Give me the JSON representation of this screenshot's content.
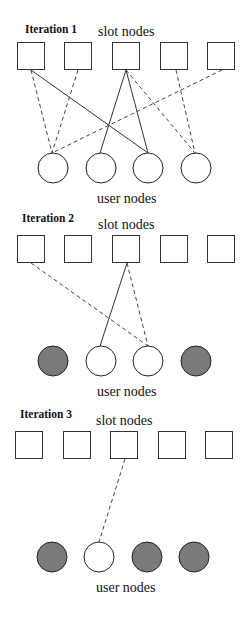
{
  "colors": {
    "assigned_fill": "#7a7a7a",
    "free_fill": "#ffffff",
    "stroke": "#333333"
  },
  "labels": {
    "slot_nodes": "slot nodes",
    "user_nodes": "user nodes"
  },
  "iterations": [
    {
      "label": "Iteration 1",
      "slot_nodes": 5,
      "user_nodes": [
        "free",
        "free",
        "free",
        "free"
      ],
      "edges": [
        {
          "slot": 1,
          "user": 1,
          "style": "dashed"
        },
        {
          "slot": 2,
          "user": 1,
          "style": "dashed"
        },
        {
          "slot": 1,
          "user": 3,
          "style": "solid"
        },
        {
          "slot": 3,
          "user": 2,
          "style": "solid"
        },
        {
          "slot": 3,
          "user": 3,
          "style": "solid"
        },
        {
          "slot": 3,
          "user": 4,
          "style": "dashed"
        },
        {
          "slot": 4,
          "user": 4,
          "style": "dashed"
        },
        {
          "slot": 5,
          "user": 1,
          "style": "dashed"
        }
      ]
    },
    {
      "label": "Iteration 2",
      "slot_nodes": 5,
      "user_nodes": [
        "assigned",
        "free",
        "free",
        "assigned"
      ],
      "edges": [
        {
          "slot": 1,
          "user": 3,
          "style": "dashed"
        },
        {
          "slot": 3,
          "user": 2,
          "style": "solid"
        },
        {
          "slot": 3,
          "user": 3,
          "style": "dashed"
        }
      ]
    },
    {
      "label": "Iteration 3",
      "slot_nodes": 5,
      "user_nodes": [
        "assigned",
        "free",
        "assigned",
        "assigned"
      ],
      "edges": [
        {
          "slot": 3,
          "user": 2,
          "style": "dashed"
        }
      ]
    }
  ]
}
